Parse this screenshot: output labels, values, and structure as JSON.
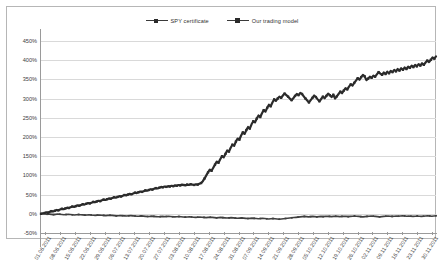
{
  "chart_data": {
    "type": "line",
    "title": "",
    "xlabel": "",
    "ylabel": "",
    "ylim": [
      -50,
      450
    ],
    "ytick_step": 50,
    "grid": true,
    "legend_position": "top-center",
    "ytick_labels": [
      "450%",
      "400%",
      "350%",
      "300%",
      "250%",
      "200%",
      "150%",
      "100%",
      "50%",
      "0%",
      "-50%"
    ],
    "ytick_values": [
      450,
      400,
      350,
      300,
      250,
      200,
      150,
      100,
      50,
      0,
      -50
    ],
    "x_tick_labels": [
      "01.06.2011",
      "08.06.2011",
      "15.06.2011",
      "22.06.2011",
      "29.06.2011",
      "06.07.2011",
      "13.07.2011",
      "20.07.2011",
      "27.07.2011",
      "03.08.2011",
      "10.08.2011",
      "17.08.2011",
      "24.08.2011",
      "31.08.2011",
      "07.09.2011",
      "14.09.2011",
      "21.09.2011",
      "28.09.2011",
      "05.10.2011",
      "12.10.2011",
      "19.10.2011",
      "26.10.2011",
      "02.11.2011",
      "09.11.2011",
      "16.11.2011",
      "23.11.2011",
      "30.11.2011"
    ],
    "series": [
      {
        "name": "SPY certificate",
        "color": "#3f3f3f",
        "marker": "line",
        "values": [
          0,
          0.5,
          -0.3,
          -1.2,
          -0.8,
          -1.5,
          -2.1,
          -1.4,
          -0.6,
          -1.1,
          -1.8,
          -2.4,
          -1.9,
          -1.3,
          -2.0,
          -2.6,
          -3.1,
          -2.5,
          -1.8,
          -2.3,
          -2.9,
          -3.4,
          -3.0,
          -2.4,
          -3.1,
          -3.6,
          -4.0,
          -3.5,
          -3.0,
          -3.6,
          -4.2,
          -4.7,
          -4.1,
          -3.6,
          -4.2,
          -4.8,
          -5.3,
          -4.9,
          -4.3,
          -4.9,
          -5.4,
          -5.8,
          -5.2,
          -4.7,
          -5.3,
          -5.9,
          -6.4,
          -6.0,
          -5.4,
          -6.0,
          -6.6,
          -7.1,
          -6.7,
          -6.1,
          -6.7,
          -7.3,
          -7.8,
          -7.4,
          -6.8,
          -7.4,
          -7.0,
          -6.4,
          -7.0,
          -7.6,
          -8.1,
          -7.6,
          -7.0,
          -7.6,
          -8.2,
          -8.7,
          -8.2,
          -7.6,
          -8.2,
          -8.8,
          -9.3,
          -8.8,
          -8.2,
          -8.8,
          -9.4,
          -9.9,
          -9.4,
          -8.8,
          -9.4,
          -10.0,
          -10.5,
          -10.0,
          -9.4,
          -10.0,
          -10.6,
          -11.1,
          -10.6,
          -10.0,
          -10.6,
          -11.2,
          -11.7,
          -11.2,
          -10.6,
          -11.2,
          -11.8,
          -12.3,
          -11.8,
          -11.2,
          -11.8,
          -12.4,
          -12.9,
          -12.4,
          -11.8,
          -12.4,
          -13.0,
          -13.5,
          -12.9,
          -12.3,
          -12.9,
          -13.5,
          -14.0,
          -13.5,
          -12.9,
          -12.2,
          -11.6,
          -11.0,
          -10.4,
          -9.8,
          -9.2,
          -8.6,
          -8.0,
          -7.4,
          -6.8,
          -7.4,
          -8.0,
          -7.4,
          -6.8,
          -7.4,
          -8.0,
          -7.4,
          -6.8,
          -7.4,
          -6.8,
          -6.2,
          -6.8,
          -7.4,
          -6.8,
          -6.2,
          -6.8,
          -7.4,
          -6.8,
          -6.2,
          -6.8,
          -7.4,
          -6.8,
          -6.2,
          -5.6,
          -6.2,
          -6.8,
          -7.4,
          -8.0,
          -7.4,
          -6.8,
          -6.2,
          -5.6,
          -6.2,
          -6.8,
          -7.4,
          -8.0,
          -7.4,
          -6.8,
          -6.2,
          -5.6,
          -6.2,
          -6.8,
          -6.2,
          -5.6,
          -6.2,
          -5.6,
          -5.0,
          -5.6,
          -6.2,
          -5.6,
          -6.2,
          -6.8,
          -6.2,
          -5.6,
          -6.2,
          -6.8,
          -6.2,
          -5.6,
          -5.0,
          -5.6,
          -6.2,
          -5.6,
          -5.0
        ]
      },
      {
        "name": "Our trading model",
        "color": "#2b2b2b",
        "marker": "square",
        "values": [
          0,
          1,
          2,
          4,
          3,
          5,
          7,
          6,
          8,
          10,
          9,
          11,
          13,
          12,
          14,
          16,
          15,
          17,
          19,
          18,
          20,
          22,
          21,
          23,
          25,
          24,
          26,
          28,
          27,
          29,
          31,
          30,
          32,
          34,
          33,
          35,
          37,
          36,
          38,
          40,
          39,
          41,
          43,
          42,
          44,
          46,
          45,
          47,
          49,
          48,
          50,
          52,
          51,
          53,
          55,
          54,
          56,
          58,
          57,
          59,
          61,
          60,
          62,
          64,
          63,
          65,
          67,
          66,
          68,
          70,
          69,
          71,
          70,
          72,
          71,
          73,
          72,
          74,
          73,
          75,
          74,
          76,
          75,
          74,
          76,
          75,
          77,
          76,
          75,
          77,
          76,
          78,
          80,
          85,
          92,
          100,
          108,
          115,
          112,
          120,
          128,
          136,
          133,
          142,
          150,
          147,
          156,
          165,
          162,
          172,
          180,
          177,
          188,
          196,
          193,
          204,
          212,
          208,
          218,
          226,
          222,
          233,
          241,
          238,
          248,
          256,
          252,
          262,
          270,
          266,
          276,
          284,
          280,
          290,
          298,
          294,
          300,
          305,
          302,
          308,
          313,
          309,
          305,
          300,
          296,
          301,
          307,
          312,
          309,
          315,
          312,
          306,
          300,
          295,
          290,
          296,
          302,
          308,
          304,
          298,
          293,
          299,
          305,
          301,
          307,
          313,
          309,
          304,
          310,
          300,
          306,
          312,
          318,
          314,
          321,
          327,
          324,
          331,
          337,
          334,
          341,
          347,
          353,
          349,
          356,
          362,
          358,
          348,
          352,
          357,
          354,
          360,
          357,
          363,
          369,
          365,
          362,
          368,
          364,
          370,
          366,
          372,
          369,
          375,
          371,
          377,
          373,
          379,
          375,
          381,
          377,
          383,
          380,
          386,
          382,
          388,
          384,
          390,
          386,
          392,
          388,
          394,
          399,
          395,
          401,
          407,
          404,
          410
        ]
      }
    ]
  },
  "legend": {
    "entries": [
      {
        "label": "SPY certificate",
        "marker_name": "legend-marker-spy"
      },
      {
        "label": "Our trading model",
        "marker_name": "legend-marker-model"
      }
    ]
  }
}
